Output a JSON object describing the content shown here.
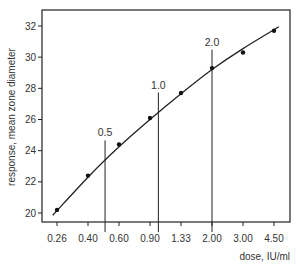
{
  "chart_data": {
    "type": "scatter",
    "title": "",
    "xlabel": "dose,  IU/ml",
    "ylabel": "response,  mean  zone  diameter",
    "x_scale": "log",
    "x_ticks": [
      0.26,
      0.4,
      0.6,
      0.9,
      1.33,
      2.0,
      3.0,
      4.5
    ],
    "x_tick_labels": [
      "0.26",
      "0.40",
      "0.60",
      "0.90",
      "1.33",
      "2.00",
      "3.00",
      "4.50"
    ],
    "y_ticks": [
      20,
      22,
      24,
      26,
      28,
      30,
      32
    ],
    "y_tick_labels": [
      "20",
      "22",
      "24",
      "26",
      "28",
      "30",
      "32"
    ],
    "ylim": [
      19.7,
      33.0
    ],
    "grid": false,
    "series": [
      {
        "name": "response",
        "points": [
          {
            "x": 0.26,
            "y": 20.2
          },
          {
            "x": 0.4,
            "y": 22.4
          },
          {
            "x": 0.6,
            "y": 24.4
          },
          {
            "x": 0.9,
            "y": 26.1
          },
          {
            "x": 1.33,
            "y": 27.7
          },
          {
            "x": 2.0,
            "y": 29.3
          },
          {
            "x": 3.0,
            "y": 30.3
          },
          {
            "x": 4.5,
            "y": 31.7
          }
        ]
      }
    ],
    "fitted_curve": [
      {
        "x": 0.245,
        "y": 19.85
      },
      {
        "x": 0.4,
        "y": 22.3
      },
      {
        "x": 0.6,
        "y": 24.25
      },
      {
        "x": 0.9,
        "y": 26.0
      },
      {
        "x": 1.33,
        "y": 27.65
      },
      {
        "x": 2.0,
        "y": 29.2
      },
      {
        "x": 3.0,
        "y": 30.55
      },
      {
        "x": 4.8,
        "y": 31.95
      }
    ],
    "reference_lines": [
      {
        "x": 0.5,
        "label": "0.5"
      },
      {
        "x": 1.0,
        "label": "1.0"
      },
      {
        "x": 2.0,
        "label": "2.0"
      }
    ]
  }
}
